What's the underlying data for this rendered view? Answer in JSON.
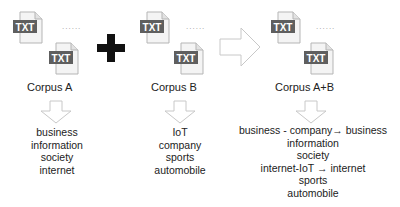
{
  "icon_text": "TXT",
  "ellipsis": "......",
  "operators": {
    "plus": "plus-icon",
    "arrow": "right-arrow-icon"
  },
  "corpora": [
    {
      "label": "Corpus A",
      "terms": [
        "business",
        "information",
        "society",
        "internet"
      ]
    },
    {
      "label": "Corpus B",
      "terms": [
        "IoT",
        "company",
        "sports",
        "automobile"
      ]
    },
    {
      "label": "Corpus A+B",
      "terms": [
        "business - company→ business",
        "information",
        "society",
        "internet-IoT → internet",
        "sports",
        "automobile"
      ]
    }
  ],
  "colors": {
    "icon_band": "#5f5f5f",
    "doc_fill": "#f4f4f4",
    "doc_stroke": "#b5b5b5",
    "arrow_stroke": "#c8c8c8",
    "plus": "#111111"
  }
}
